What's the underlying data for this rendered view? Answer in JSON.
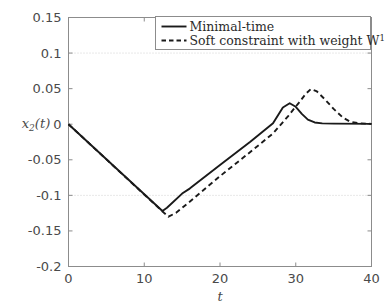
{
  "chart_data": {
    "type": "line",
    "title": "",
    "xlabel": "t",
    "ylabel": "x_2(t)",
    "ylabel_parts": {
      "base": "x",
      "subscript": "2",
      "tail": "(t)"
    },
    "xlim": [
      0,
      40
    ],
    "ylim": [
      -0.2,
      0.15
    ],
    "xticks": [
      0,
      10,
      20,
      30,
      40
    ],
    "yticks": [
      0.15,
      0.1,
      0.05,
      0,
      -0.05,
      -0.1,
      -0.15,
      -0.2
    ],
    "xticklabels": [
      "0",
      "10",
      "20",
      "30",
      "40"
    ],
    "yticklabels": [
      "0.15",
      "0.1",
      "0.05",
      "0",
      "-0.05",
      "-0.1",
      "-0.15",
      "-0.2"
    ],
    "grid": "horizontal dotted at y = 0.1 and y = -0.1",
    "gridlines_y": [
      0.1,
      -0.1
    ],
    "legend_position": "top-center",
    "series": [
      {
        "name": "Minimal-time",
        "style": "solid",
        "color": "#1a1a1a",
        "points": [
          [
            0,
            0.0
          ],
          [
            12.4,
            -0.122
          ],
          [
            13.0,
            -0.1175
          ],
          [
            15.0,
            -0.0975
          ],
          [
            16.0,
            -0.0905
          ],
          [
            20.0,
            -0.0575
          ],
          [
            24.0,
            -0.0245
          ],
          [
            27.0,
            0.0015
          ],
          [
            28.3,
            0.0235
          ],
          [
            29.2,
            0.0295
          ],
          [
            30.0,
            0.0245
          ],
          [
            30.8,
            0.0145
          ],
          [
            31.6,
            0.0065
          ],
          [
            32.5,
            0.0025
          ],
          [
            33.5,
            0.0012
          ],
          [
            35.0,
            0.0008
          ],
          [
            40.0,
            0.0005
          ]
        ]
      },
      {
        "name": "Soft constraint with weight W",
        "name_superscript": "1",
        "style": "dashed",
        "color": "#1a1a1a",
        "points": [
          [
            0,
            0.0
          ],
          [
            12.6,
            -0.1245
          ],
          [
            13.2,
            -0.13
          ],
          [
            14.2,
            -0.1245
          ],
          [
            16.0,
            -0.109
          ],
          [
            20.0,
            -0.073
          ],
          [
            24.0,
            -0.039
          ],
          [
            27.0,
            -0.013
          ],
          [
            29.0,
            0.0115
          ],
          [
            30.4,
            0.03
          ],
          [
            31.3,
            0.0425
          ],
          [
            32.0,
            0.0495
          ],
          [
            32.8,
            0.046
          ],
          [
            33.8,
            0.0355
          ],
          [
            35.0,
            0.0215
          ],
          [
            36.2,
            0.0095
          ],
          [
            37.2,
            0.0035
          ],
          [
            38.4,
            0.0012
          ],
          [
            40.0,
            0.0005
          ]
        ]
      }
    ]
  },
  "legend": {
    "items": [
      {
        "label": "Minimal-time",
        "style": "solid"
      },
      {
        "label": "Soft constraint with weight W",
        "superscript": "1",
        "style": "dashed"
      }
    ]
  },
  "colors": {
    "axis": "#8c8c8c",
    "text": "#4a4a4a",
    "line": "#1a1a1a",
    "grid": "#cfcfcf",
    "background": "#ffffff"
  }
}
